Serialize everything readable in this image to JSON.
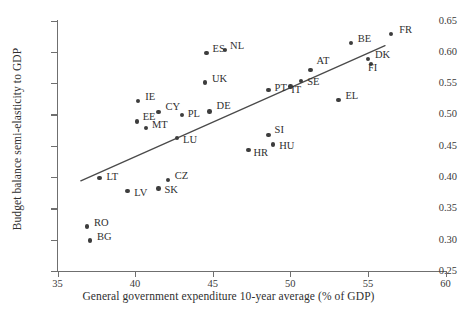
{
  "chart_data": {
    "type": "scatter",
    "title": "",
    "xlabel": "General  government expenditure 10-year average (% of GDP)",
    "ylabel": "Budget balance semi-elasticity to GDP",
    "xlim": [
      35,
      60
    ],
    "ylim": [
      0.25,
      0.65
    ],
    "xticks": [
      "35",
      "40",
      "45",
      "50",
      "55",
      "60"
    ],
    "xtick_values": [
      35,
      40,
      45,
      50,
      55,
      60
    ],
    "yticks": [
      "0.25",
      "0.30",
      "0.35",
      "0.40",
      "0.45",
      "0.50",
      "0.55",
      "0.60",
      "0.65"
    ],
    "ytick_values": [
      0.25,
      0.3,
      0.35,
      0.4,
      0.45,
      0.5,
      0.55,
      0.6,
      0.65
    ],
    "grid": false,
    "legend": "none",
    "marker_color": "#3d3d3d",
    "line_color": "#4a4a4a",
    "points": [
      {
        "label": "FR",
        "x": 56.5,
        "y": 0.629,
        "lx": 8,
        "ly": -4
      },
      {
        "label": "BE",
        "x": 53.9,
        "y": 0.614,
        "lx": 7,
        "ly": -4
      },
      {
        "label": "DK",
        "x": 55.0,
        "y": 0.589,
        "lx": 7,
        "ly": -4
      },
      {
        "label": "FI",
        "x": 55.2,
        "y": 0.581,
        "lx": -3,
        "ly": 4
      },
      {
        "label": "NL",
        "x": 45.8,
        "y": 0.603,
        "lx": 5,
        "ly": -4
      },
      {
        "label": "ES",
        "x": 44.6,
        "y": 0.598,
        "lx": 6,
        "ly": -4
      },
      {
        "label": "AT",
        "x": 51.3,
        "y": 0.571,
        "lx": 6,
        "ly": -9
      },
      {
        "label": "SE",
        "x": 50.7,
        "y": 0.553,
        "lx": 6,
        "ly": 1
      },
      {
        "label": "UK",
        "x": 44.5,
        "y": 0.551,
        "lx": 7,
        "ly": -4
      },
      {
        "label": "IT",
        "x": 50.0,
        "y": 0.545,
        "lx": 1,
        "ly": 4
      },
      {
        "label": "PT",
        "x": 48.6,
        "y": 0.539,
        "lx": 6,
        "ly": -2
      },
      {
        "label": "EL",
        "x": 53.1,
        "y": 0.523,
        "lx": 7,
        "ly": -4
      },
      {
        "label": "IE",
        "x": 40.2,
        "y": 0.522,
        "lx": 7,
        "ly": -4
      },
      {
        "label": "CY",
        "x": 41.5,
        "y": 0.504,
        "lx": 7,
        "ly": -5
      },
      {
        "label": "DE",
        "x": 44.8,
        "y": 0.505,
        "lx": 7,
        "ly": -5
      },
      {
        "label": "PL",
        "x": 43.0,
        "y": 0.499,
        "lx": 6,
        "ly": -1
      },
      {
        "label": "EE",
        "x": 40.1,
        "y": 0.489,
        "lx": 6,
        "ly": -4
      },
      {
        "label": "MT",
        "x": 40.7,
        "y": 0.478,
        "lx": 6,
        "ly": -3
      },
      {
        "label": "SI",
        "x": 48.6,
        "y": 0.467,
        "lx": 6,
        "ly": -5
      },
      {
        "label": "LU",
        "x": 42.7,
        "y": 0.462,
        "lx": 6,
        "ly": 2
      },
      {
        "label": "HU",
        "x": 48.9,
        "y": 0.452,
        "lx": 6,
        "ly": 1
      },
      {
        "label": "HR",
        "x": 47.3,
        "y": 0.443,
        "lx": 5,
        "ly": 3
      },
      {
        "label": "LT",
        "x": 37.7,
        "y": 0.399,
        "lx": 7,
        "ly": -1
      },
      {
        "label": "CZ",
        "x": 42.1,
        "y": 0.395,
        "lx": 7,
        "ly": -4
      },
      {
        "label": "SK",
        "x": 41.5,
        "y": 0.382,
        "lx": 6,
        "ly": 2
      },
      {
        "label": "LV",
        "x": 39.5,
        "y": 0.378,
        "lx": 7,
        "ly": 2
      },
      {
        "label": "RO",
        "x": 36.9,
        "y": 0.321,
        "lx": 7,
        "ly": -4
      },
      {
        "label": "BG",
        "x": 37.1,
        "y": 0.299,
        "lx": 7,
        "ly": -3
      }
    ],
    "trend_line": {
      "x0": 36.5,
      "y0": 0.394,
      "x1": 56.1,
      "y1": 0.61
    }
  }
}
